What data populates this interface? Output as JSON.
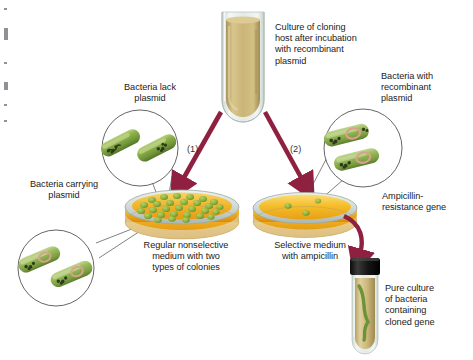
{
  "figure": {
    "colors": {
      "arrow": "#8f2040",
      "agar_nonselective": "#f0a81e",
      "agar_selective": "#f5b91f",
      "colony_green": "#8ab23c",
      "bacteria_body": "#7ba23f",
      "bacteria_body_light": "#a8c46a",
      "chromosome_dark": "#2f3a1c",
      "plasmid_pink": "#d9a08c",
      "culture_tan": "#c9b477",
      "glass": "#dfe6e2",
      "cap_black": "#141414",
      "text": "#222222",
      "leader_line": "#4a4a4a"
    },
    "labels": {
      "culture_tube": "Culture of cloning\nhost after incubation\nwith recombinant\nplasmid",
      "bacteria_lack_plasmid": "Bacteria lack\nplasmid",
      "bacteria_with_recombinant_plasmid": "Bacteria with\nrecombinant\nplasmid",
      "bacteria_carrying_plasmid": "Bacteria carrying\nplasmid",
      "ampicillin_resistance_gene": "Ampicillin-\nresistance gene",
      "nonselective_plate": "Regular nonselective\nmedium with two\ntypes of colonies",
      "selective_plate": "Selective medium\nwith ampicillin",
      "pure_culture": "Pure culture\nof bacteria\ncontaining\ncloned gene",
      "step_one": "(1)",
      "step_two": "(2)"
    },
    "icons": {
      "culture_tube": "test-tube-icon",
      "petri_dish": "petri-dish-icon",
      "bacterium": "bacterium-rod-icon",
      "arrow": "arrow-icon",
      "colony": "colony-dot-icon",
      "slant_tube": "capped-test-tube-icon",
      "callout_circle": "magnified-circle-icon"
    },
    "counts": {
      "nonselective_colonies": 29,
      "selective_colonies": 3,
      "callout_circles": 3,
      "bacteria_per_callout": 2,
      "steps": 2
    }
  }
}
